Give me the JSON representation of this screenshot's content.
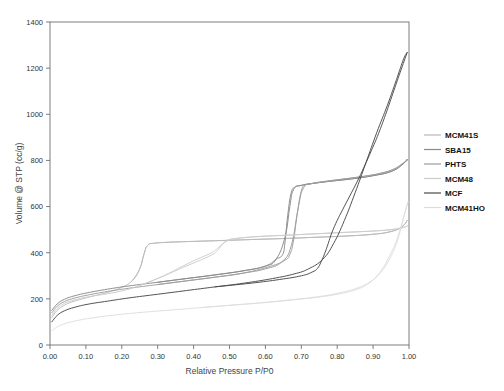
{
  "chart_data": {
    "type": "line",
    "title": "",
    "xlabel": "Relative Pressure P/P0",
    "ylabel": "Volume @ STP (cc/g)",
    "xlim": [
      0.0,
      1.0
    ],
    "ylim": [
      0,
      1400
    ],
    "xticks": [
      "0.00",
      "0.10",
      "0.20",
      "0.30",
      "0.40",
      "0.50",
      "0.60",
      "0.70",
      "0.80",
      "0.90",
      "1.00"
    ],
    "xtick_values": [
      0.0,
      0.1,
      0.2,
      0.3,
      0.4,
      0.5,
      0.6,
      0.7,
      0.8,
      0.9,
      1.0
    ],
    "yticks": [
      "0",
      "200",
      "400",
      "600",
      "800",
      "1000",
      "1200",
      "1400"
    ],
    "ytick_values": [
      0,
      200,
      400,
      600,
      800,
      1000,
      1200,
      1400
    ],
    "grid": false,
    "legend_position": "right",
    "series": [
      {
        "name": "MCM41S",
        "color": "#b9b9b9",
        "adsorption": [
          [
            0.005,
            118
          ],
          [
            0.02,
            150
          ],
          [
            0.04,
            172
          ],
          [
            0.06,
            186
          ],
          [
            0.09,
            200
          ],
          [
            0.12,
            212
          ],
          [
            0.16,
            228
          ],
          [
            0.2,
            250
          ],
          [
            0.23,
            280
          ],
          [
            0.25,
            330
          ],
          [
            0.262,
            395
          ],
          [
            0.272,
            432
          ],
          [
            0.29,
            441
          ],
          [
            0.34,
            446
          ],
          [
            0.42,
            450
          ],
          [
            0.5,
            454
          ],
          [
            0.58,
            458
          ],
          [
            0.66,
            462
          ],
          [
            0.74,
            467
          ],
          [
            0.82,
            472
          ],
          [
            0.9,
            480
          ],
          [
            0.95,
            492
          ],
          [
            0.98,
            512
          ],
          [
            0.995,
            540
          ]
        ],
        "desorption": [
          [
            0.995,
            540
          ],
          [
            0.98,
            512
          ],
          [
            0.95,
            492
          ],
          [
            0.9,
            480
          ],
          [
            0.82,
            472
          ],
          [
            0.74,
            467
          ],
          [
            0.66,
            462
          ],
          [
            0.58,
            458
          ],
          [
            0.5,
            454
          ],
          [
            0.42,
            450
          ],
          [
            0.34,
            446
          ],
          [
            0.29,
            441
          ],
          [
            0.272,
            432
          ],
          [
            0.262,
            395
          ],
          [
            0.25,
            330
          ],
          [
            0.23,
            280
          ]
        ]
      },
      {
        "name": "SBA15",
        "color": "#8a8a8a",
        "adsorption": [
          [
            0.005,
            150
          ],
          [
            0.02,
            178
          ],
          [
            0.04,
            198
          ],
          [
            0.07,
            214
          ],
          [
            0.11,
            228
          ],
          [
            0.16,
            242
          ],
          [
            0.22,
            256
          ],
          [
            0.3,
            272
          ],
          [
            0.38,
            288
          ],
          [
            0.46,
            304
          ],
          [
            0.54,
            322
          ],
          [
            0.6,
            342
          ],
          [
            0.63,
            372
          ],
          [
            0.655,
            470
          ],
          [
            0.668,
            600
          ],
          [
            0.678,
            672
          ],
          [
            0.7,
            692
          ],
          [
            0.76,
            706
          ],
          [
            0.84,
            720
          ],
          [
            0.9,
            734
          ],
          [
            0.95,
            752
          ],
          [
            0.98,
            780
          ],
          [
            0.995,
            805
          ]
        ],
        "desorption": [
          [
            0.995,
            805
          ],
          [
            0.98,
            780
          ],
          [
            0.95,
            752
          ],
          [
            0.9,
            734
          ],
          [
            0.84,
            720
          ],
          [
            0.76,
            706
          ],
          [
            0.7,
            692
          ],
          [
            0.684,
            686
          ],
          [
            0.672,
            660
          ],
          [
            0.662,
            560
          ],
          [
            0.655,
            450
          ],
          [
            0.648,
            392
          ],
          [
            0.63,
            372
          ],
          [
            0.6,
            342
          ],
          [
            0.54,
            322
          ],
          [
            0.46,
            304
          ],
          [
            0.38,
            288
          ],
          [
            0.3,
            272
          ]
        ]
      },
      {
        "name": "PHTS",
        "color": "#9d9d9d",
        "adsorption": [
          [
            0.005,
            140
          ],
          [
            0.02,
            168
          ],
          [
            0.04,
            188
          ],
          [
            0.07,
            204
          ],
          [
            0.11,
            218
          ],
          [
            0.16,
            232
          ],
          [
            0.22,
            246
          ],
          [
            0.3,
            262
          ],
          [
            0.38,
            278
          ],
          [
            0.46,
            294
          ],
          [
            0.54,
            312
          ],
          [
            0.6,
            330
          ],
          [
            0.645,
            360
          ],
          [
            0.672,
            430
          ],
          [
            0.692,
            600
          ],
          [
            0.706,
            680
          ],
          [
            0.73,
            700
          ],
          [
            0.79,
            714
          ],
          [
            0.86,
            728
          ],
          [
            0.92,
            744
          ],
          [
            0.96,
            764
          ],
          [
            0.985,
            790
          ],
          [
            0.995,
            800
          ]
        ],
        "desorption": [
          [
            0.995,
            800
          ],
          [
            0.985,
            790
          ],
          [
            0.96,
            764
          ],
          [
            0.92,
            744
          ],
          [
            0.86,
            728
          ],
          [
            0.79,
            714
          ],
          [
            0.73,
            700
          ],
          [
            0.712,
            694
          ],
          [
            0.7,
            668
          ],
          [
            0.688,
            560
          ],
          [
            0.678,
            450
          ],
          [
            0.668,
            392
          ],
          [
            0.655,
            368
          ],
          [
            0.62,
            344
          ],
          [
            0.54,
            312
          ],
          [
            0.46,
            294
          ],
          [
            0.38,
            278
          ],
          [
            0.3,
            262
          ]
        ]
      },
      {
        "name": "MCM48",
        "color": "#cccccc",
        "adsorption": [
          [
            0.005,
            128
          ],
          [
            0.02,
            158
          ],
          [
            0.04,
            180
          ],
          [
            0.07,
            196
          ],
          [
            0.11,
            210
          ],
          [
            0.16,
            222
          ],
          [
            0.21,
            238
          ],
          [
            0.25,
            258
          ],
          [
            0.29,
            282
          ],
          [
            0.33,
            310
          ],
          [
            0.37,
            342
          ],
          [
            0.41,
            372
          ],
          [
            0.45,
            400
          ],
          [
            0.475,
            430
          ],
          [
            0.495,
            452
          ],
          [
            0.52,
            462
          ],
          [
            0.58,
            470
          ],
          [
            0.66,
            476
          ],
          [
            0.74,
            482
          ],
          [
            0.82,
            488
          ],
          [
            0.9,
            494
          ],
          [
            0.95,
            500
          ],
          [
            0.98,
            508
          ],
          [
            0.995,
            516
          ]
        ],
        "desorption": [
          [
            0.995,
            516
          ],
          [
            0.98,
            508
          ],
          [
            0.95,
            500
          ],
          [
            0.9,
            494
          ],
          [
            0.82,
            488
          ],
          [
            0.74,
            482
          ],
          [
            0.66,
            476
          ],
          [
            0.58,
            470
          ],
          [
            0.52,
            462
          ],
          [
            0.498,
            456
          ],
          [
            0.482,
            440
          ],
          [
            0.468,
            412
          ],
          [
            0.45,
            390
          ],
          [
            0.41,
            362
          ],
          [
            0.37,
            336
          ],
          [
            0.33,
            308
          ],
          [
            0.29,
            282
          ],
          [
            0.25,
            258
          ]
        ]
      },
      {
        "name": "MCF",
        "color": "#4a4a4a",
        "adsorption": [
          [
            0.005,
            100
          ],
          [
            0.02,
            128
          ],
          [
            0.04,
            148
          ],
          [
            0.07,
            164
          ],
          [
            0.11,
            178
          ],
          [
            0.16,
            190
          ],
          [
            0.22,
            204
          ],
          [
            0.3,
            220
          ],
          [
            0.38,
            236
          ],
          [
            0.46,
            252
          ],
          [
            0.54,
            268
          ],
          [
            0.62,
            288
          ],
          [
            0.68,
            308
          ],
          [
            0.72,
            330
          ],
          [
            0.76,
            372
          ],
          [
            0.79,
            440
          ],
          [
            0.82,
            540
          ],
          [
            0.85,
            660
          ],
          [
            0.88,
            790
          ],
          [
            0.91,
            920
          ],
          [
            0.94,
            1040
          ],
          [
            0.965,
            1150
          ],
          [
            0.985,
            1240
          ],
          [
            0.995,
            1268
          ]
        ],
        "desorption": [
          [
            0.995,
            1268
          ],
          [
            0.975,
            1180
          ],
          [
            0.955,
            1090
          ],
          [
            0.935,
            1000
          ],
          [
            0.915,
            916
          ],
          [
            0.895,
            842
          ],
          [
            0.875,
            772
          ],
          [
            0.855,
            706
          ],
          [
            0.835,
            646
          ],
          [
            0.815,
            586
          ],
          [
            0.8,
            540
          ],
          [
            0.785,
            486
          ],
          [
            0.775,
            440
          ],
          [
            0.765,
            396
          ],
          [
            0.755,
            360
          ],
          [
            0.745,
            332
          ],
          [
            0.73,
            316
          ],
          [
            0.7,
            300
          ],
          [
            0.64,
            284
          ],
          [
            0.56,
            268
          ],
          [
            0.46,
            252
          ]
        ]
      },
      {
        "name": "MCM41HO",
        "color": "#dddddd",
        "adsorption": [
          [
            0.005,
            62
          ],
          [
            0.03,
            86
          ],
          [
            0.07,
            104
          ],
          [
            0.12,
            118
          ],
          [
            0.18,
            130
          ],
          [
            0.26,
            142
          ],
          [
            0.34,
            152
          ],
          [
            0.42,
            162
          ],
          [
            0.5,
            172
          ],
          [
            0.58,
            182
          ],
          [
            0.66,
            194
          ],
          [
            0.74,
            208
          ],
          [
            0.8,
            224
          ],
          [
            0.85,
            244
          ],
          [
            0.89,
            272
          ],
          [
            0.92,
            312
          ],
          [
            0.945,
            370
          ],
          [
            0.965,
            440
          ],
          [
            0.98,
            520
          ],
          [
            0.99,
            580
          ],
          [
            0.997,
            620
          ]
        ],
        "desorption": [
          [
            0.997,
            620
          ],
          [
            0.99,
            582
          ],
          [
            0.98,
            528
          ],
          [
            0.965,
            452
          ],
          [
            0.945,
            384
          ],
          [
            0.925,
            328
          ],
          [
            0.905,
            290
          ],
          [
            0.885,
            264
          ],
          [
            0.86,
            244
          ],
          [
            0.82,
            226
          ],
          [
            0.76,
            210
          ],
          [
            0.68,
            196
          ],
          [
            0.6,
            184
          ],
          [
            0.5,
            172
          ],
          [
            0.42,
            162
          ]
        ]
      }
    ]
  },
  "legend": {
    "items": [
      {
        "label": "MCM41S"
      },
      {
        "label": "SBA15"
      },
      {
        "label": "PHTS"
      },
      {
        "label": "MCM48"
      },
      {
        "label": "MCF"
      },
      {
        "label": "MCM41HO"
      }
    ]
  }
}
